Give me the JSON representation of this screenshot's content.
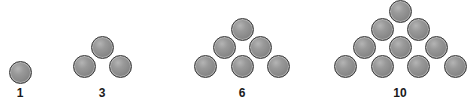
{
  "diagram": {
    "ball_color": "#8c8c8c",
    "outline_color": "#3a3a3a",
    "groups": [
      {
        "label": "1",
        "center_x": 20,
        "balls": [
          [
            20,
            72
          ]
        ]
      },
      {
        "label": "3",
        "center_x": 102,
        "balls": [
          [
            102,
            47
          ],
          [
            84,
            66
          ],
          [
            120,
            66
          ]
        ]
      },
      {
        "label": "6",
        "center_x": 242,
        "balls": [
          [
            242,
            29
          ],
          [
            224,
            47
          ],
          [
            260,
            47
          ],
          [
            205,
            66
          ],
          [
            242,
            66
          ],
          [
            278,
            66
          ]
        ]
      },
      {
        "label": "10",
        "center_x": 400,
        "balls": [
          [
            400,
            11
          ],
          [
            382,
            29
          ],
          [
            418,
            29
          ],
          [
            364,
            47
          ],
          [
            400,
            47
          ],
          [
            436,
            47
          ],
          [
            345,
            66
          ],
          [
            382,
            66
          ],
          [
            418,
            66
          ],
          [
            455,
            66
          ]
        ]
      }
    ]
  }
}
